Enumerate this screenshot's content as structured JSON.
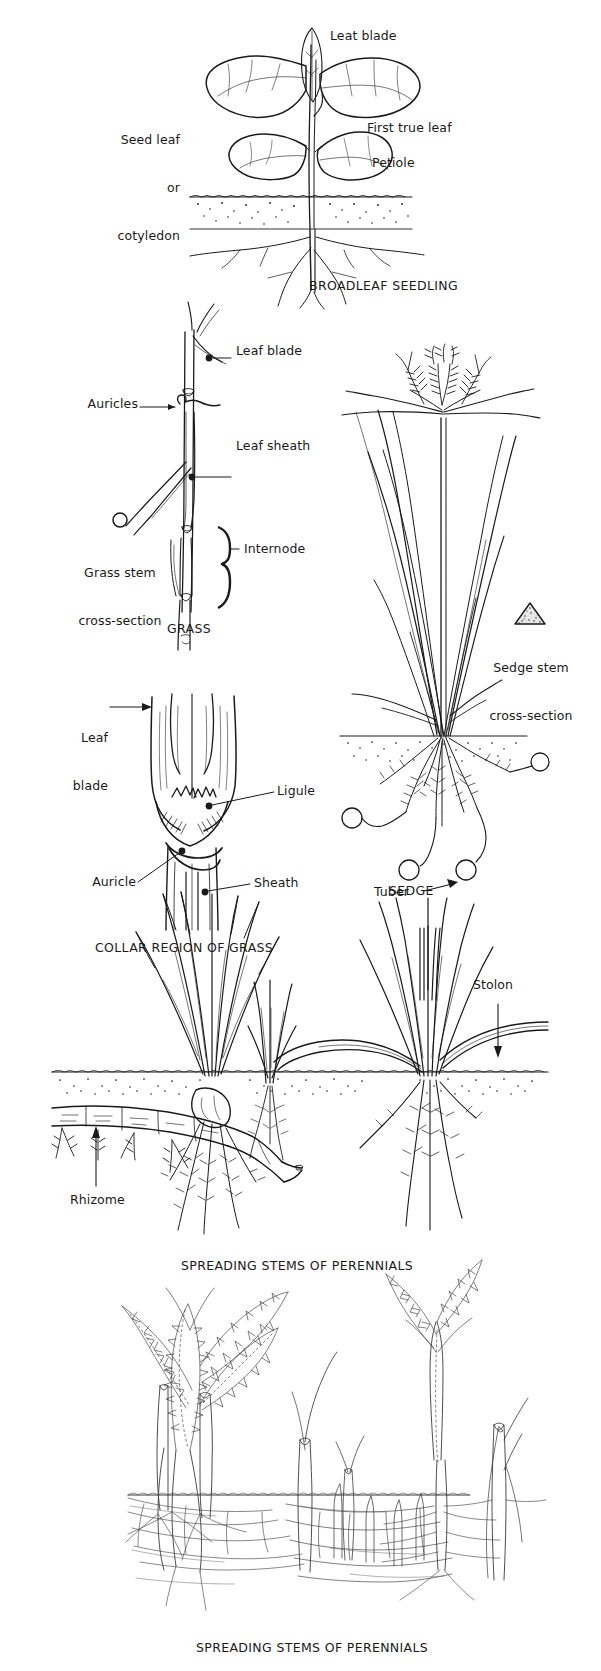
{
  "page": {
    "width": 601,
    "height": 1671,
    "background": "#ffffff",
    "ink": "#1a1a1a"
  },
  "panels": [
    {
      "id": "broadleaf",
      "caption": "BROADLEAF SEEDLING",
      "labels": [
        {
          "id": "leaf-blade",
          "text": "Leat blade"
        },
        {
          "id": "seed-leaf",
          "text": "Seed leaf\nor\ncotyledon"
        },
        {
          "id": "first-true-leaf",
          "text": "First true leaf"
        },
        {
          "id": "petiole",
          "text": "Petiole"
        }
      ]
    },
    {
      "id": "grass",
      "caption": "GRASS",
      "labels": [
        {
          "id": "leaf-blade",
          "text": "Leaf blade"
        },
        {
          "id": "auricles",
          "text": "Auricles"
        },
        {
          "id": "leaf-sheath",
          "text": "Leaf sheath"
        },
        {
          "id": "internode",
          "text": "Internode"
        },
        {
          "id": "grass-stem-cross-section",
          "text": "Grass stem\ncross-section"
        }
      ]
    },
    {
      "id": "sedge",
      "caption": "SEDGE",
      "labels": [
        {
          "id": "sedge-stem-cross-section",
          "text": "Sedge stem\ncross-section"
        },
        {
          "id": "tuber",
          "text": "Tuber"
        }
      ]
    },
    {
      "id": "collar-region",
      "caption": "COLLAR REGION OF GRASS",
      "labels": [
        {
          "id": "leaf-blade",
          "text": "Leaf\nblade"
        },
        {
          "id": "ligule",
          "text": "Ligule"
        },
        {
          "id": "auricle",
          "text": "Auricle"
        },
        {
          "id": "sheath",
          "text": "Sheath"
        }
      ]
    },
    {
      "id": "spreading-stems-line",
      "caption": "SPREADING STEMS OF PERENNIALS",
      "labels": [
        {
          "id": "stolon",
          "text": "Stolon"
        },
        {
          "id": "rhizome",
          "text": "Rhizome"
        }
      ]
    },
    {
      "id": "spreading-stems-scene",
      "caption": "SPREADING STEMS OF PERENNIALS",
      "labels": []
    }
  ],
  "labels": {
    "broadleaf_leaf_blade": "Leat blade",
    "broadleaf_seed_leaf_l1": "Seed leaf",
    "broadleaf_seed_leaf_l2": "or",
    "broadleaf_seed_leaf_l3": "cotyledon",
    "broadleaf_first_true_leaf": "First true leaf",
    "broadleaf_petiole": "Petiole",
    "broadleaf_caption": "BROADLEAF SEEDLING",
    "grass_leaf_blade": "Leaf blade",
    "grass_auricles": "Auricles",
    "grass_leaf_sheath": "Leaf sheath",
    "grass_internode": "Internode",
    "grass_cross_l1": "Grass stem",
    "grass_cross_l2": "cross-section",
    "grass_caption": "GRASS",
    "sedge_cross_l1": "Sedge stem",
    "sedge_cross_l2": "cross-section",
    "sedge_tuber": "Tuber",
    "sedge_caption": "SEDGE",
    "collar_leaf_l1": "Leaf",
    "collar_leaf_l2": "blade",
    "collar_ligule": "Ligule",
    "collar_auricle": "Auricle",
    "collar_sheath": "Sheath",
    "collar_caption": "COLLAR REGION OF GRASS",
    "perennial_stolon": "Stolon",
    "perennial_rhizome": "Rhizome",
    "perennial_caption_1": "SPREADING STEMS OF PERENNIALS",
    "perennial_caption_2": "SPREADING STEMS OF PERENNIALS"
  }
}
